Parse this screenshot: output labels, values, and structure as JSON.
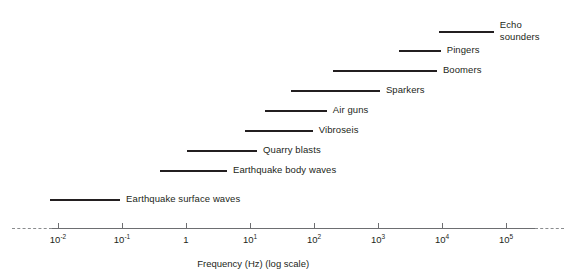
{
  "chart_data": {
    "type": "bar",
    "orientation": "horizontal",
    "title": "",
    "subtitle": "",
    "xlabel": "Frequency (Hz) (log scale)",
    "ylabel": "",
    "scale": "log10",
    "grid": false,
    "legend": "none",
    "annotations": "Each horizontal bar shows the approximate frequency band (Hz) of a seismic or acoustic source; axis is logarithmic and continues dashed beyond the plotted decades.",
    "xlim_log10": [
      -2.6,
      5.9
    ],
    "axis": {
      "solid_start_log10": -2.1,
      "solid_end_log10": 5.45,
      "dashed_left_start_log10": -2.72,
      "dashed_left_end_log10": -2.1,
      "dashed_right_start_log10": 5.45,
      "dashed_right_end_log10": 5.9,
      "ticks": [
        {
          "log10": -2,
          "label": "10",
          "exponent": "-2"
        },
        {
          "log10": -1,
          "label": "10",
          "exponent": "-1"
        },
        {
          "log10": 0,
          "label": "1",
          "exponent": ""
        },
        {
          "log10": 1,
          "label": "10",
          "exponent": "1"
        },
        {
          "log10": 2,
          "label": "10",
          "exponent": "2"
        },
        {
          "log10": 3,
          "label": "10",
          "exponent": "3"
        },
        {
          "log10": 4,
          "label": "10",
          "exponent": "4"
        },
        {
          "log10": 5,
          "label": "10",
          "exponent": "5"
        }
      ]
    },
    "categories": [
      "Echo sounders",
      "Pingers",
      "Boomers",
      "Sparkers",
      "Air guns",
      "Vibroseis",
      "Quarry blasts",
      "Earthquake body waves",
      "Earthquake surface waves"
    ],
    "bars": [
      {
        "name": "Echo sounders",
        "label_lines": [
          "Echo",
          "sounders"
        ],
        "x_start_log10": 3.96,
        "x_end_log10": 4.81,
        "x_start_hz": 9120,
        "x_end_hz": 64600,
        "row": 0
      },
      {
        "name": "Pingers",
        "label_lines": [
          "Pingers"
        ],
        "x_start_log10": 3.33,
        "x_end_log10": 3.98,
        "x_start_hz": 2140,
        "x_end_hz": 9550,
        "row": 1
      },
      {
        "name": "Boomers",
        "label_lines": [
          "Boomers"
        ],
        "x_start_log10": 2.3,
        "x_end_log10": 3.92,
        "x_start_hz": 200,
        "x_end_hz": 8320,
        "row": 2
      },
      {
        "name": "Sparkers",
        "label_lines": [
          "Sparkers"
        ],
        "x_start_log10": 1.64,
        "x_end_log10": 3.03,
        "x_start_hz": 43.7,
        "x_end_hz": 1070,
        "row": 3
      },
      {
        "name": "Air guns",
        "label_lines": [
          "Air guns"
        ],
        "x_start_log10": 1.23,
        "x_end_log10": 2.2,
        "x_start_hz": 17.0,
        "x_end_hz": 158,
        "row": 4
      },
      {
        "name": "Vibroseis",
        "label_lines": [
          "Vibroseis"
        ],
        "x_start_log10": 0.92,
        "x_end_log10": 1.98,
        "x_start_hz": 8.3,
        "x_end_hz": 95.5,
        "row": 5
      },
      {
        "name": "Quarry blasts",
        "label_lines": [
          "Quarry blasts"
        ],
        "x_start_log10": 0.02,
        "x_end_log10": 1.11,
        "x_start_hz": 1.0,
        "x_end_hz": 12.9,
        "row": 6
      },
      {
        "name": "Earthquake body waves",
        "label_lines": [
          "Earthquake body waves"
        ],
        "x_start_log10": -0.41,
        "x_end_log10": 0.64,
        "x_start_hz": 0.39,
        "x_end_hz": 4.4,
        "row": 7
      },
      {
        "name": "Earthquake surface waves",
        "label_lines": [
          "Earthquake surface waves"
        ],
        "x_start_log10": -2.13,
        "x_end_log10": -1.03,
        "x_start_hz": 0.0074,
        "x_end_hz": 0.093,
        "row": 8
      }
    ]
  },
  "colors": {
    "bar": "#231f20",
    "axis": "#6d6e71",
    "axis_dash": "#8a8c8e",
    "text": "#231f20",
    "background": "#ffffff"
  },
  "geometry": {
    "px_per_decade": 64,
    "x_origin_px": 186,
    "axis_y_px": 228,
    "row_y_px": [
      31,
      50,
      70,
      90,
      110,
      130,
      150,
      170,
      199
    ],
    "label_gap_px": 6
  }
}
